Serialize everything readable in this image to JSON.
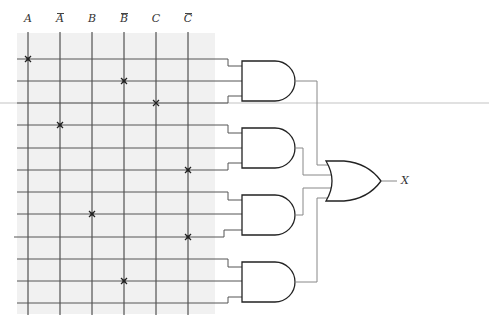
{
  "diagram": {
    "type": "programmable logic array (AND-OR) fuse map",
    "inputs": [
      {
        "label": "A",
        "negated": false
      },
      {
        "label": "A",
        "negated": true
      },
      {
        "label": "B",
        "negated": false
      },
      {
        "label": "B",
        "negated": true
      },
      {
        "label": "C",
        "negated": false
      },
      {
        "label": "C",
        "negated": true
      }
    ],
    "rows": 12,
    "connections": [
      {
        "row": 1,
        "input": "A"
      },
      {
        "row": 2,
        "input": "B̄"
      },
      {
        "row": 3,
        "input": "C"
      },
      {
        "row": 4,
        "input": "Ā"
      },
      {
        "row": 6,
        "input": "C̄"
      },
      {
        "row": 8,
        "input": "B"
      },
      {
        "row": 9,
        "input": "C̄"
      },
      {
        "row": 11,
        "input": "B̄"
      }
    ],
    "and_gates": [
      {
        "name": "AND1",
        "rows": [
          1,
          2,
          3
        ]
      },
      {
        "name": "AND2",
        "rows": [
          4,
          5,
          6
        ]
      },
      {
        "name": "AND3",
        "rows": [
          7,
          8,
          9
        ]
      },
      {
        "name": "AND4",
        "rows": [
          10,
          11,
          12
        ]
      }
    ],
    "or_gate": {
      "name": "OR",
      "inputs": [
        "AND1",
        "AND2",
        "AND3",
        "AND4"
      ]
    },
    "output": {
      "label": "X"
    },
    "colors": {
      "grid_line": "#333333",
      "wire": "#8a8a8a",
      "gate_outline": "#222222",
      "shading": "#f0f0f0",
      "fuse_mark": "#222222"
    }
  }
}
